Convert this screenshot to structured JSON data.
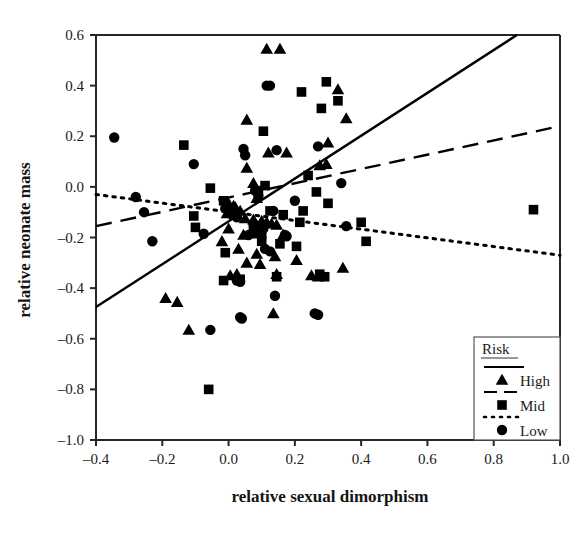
{
  "chart_data": {
    "type": "scatter",
    "title": "",
    "xlabel": "relative sexual dimorphism",
    "ylabel": "relative neonate mass",
    "xlim": [
      -0.4,
      1.0
    ],
    "ylim": [
      -1.0,
      0.6
    ],
    "xticks": [
      "-0.4",
      "-0.2",
      "0.0",
      "0.2",
      "0.4",
      "0.6",
      "0.8",
      "1.0"
    ],
    "xtick_values": [
      -0.4,
      -0.2,
      0.0,
      0.2,
      0.4,
      0.6,
      0.8,
      1.0
    ],
    "yticks": [
      "0.6",
      "0.4",
      "0.2",
      "0.0",
      "-0.2",
      "-0.4",
      "-0.6",
      "-0.8",
      "-1.0"
    ],
    "ytick_values": [
      0.6,
      0.4,
      0.2,
      0.0,
      -0.2,
      -0.4,
      -0.6,
      -0.8,
      -1.0
    ],
    "grid": false,
    "legend_position": "bottom-right",
    "legend_title": "Risk",
    "series": [
      {
        "name": "High",
        "marker": "triangle",
        "line_style": "solid",
        "color": "#000000",
        "points": [
          [
            0.115,
            0.545
          ],
          [
            0.155,
            0.545
          ],
          [
            0.33,
            0.385
          ],
          [
            0.055,
            0.265
          ],
          [
            0.12,
            0.135
          ],
          [
            0.175,
            0.135
          ],
          [
            0.055,
            0.075
          ],
          [
            0.075,
            0.015
          ],
          [
            0.355,
            0.27
          ],
          [
            0.3,
            0.175
          ],
          [
            0.085,
            -0.045
          ],
          [
            0.275,
            0.085
          ],
          [
            0.295,
            0.09
          ],
          [
            0.0,
            -0.065
          ],
          [
            0.015,
            -0.075
          ],
          [
            0.02,
            -0.08
          ],
          [
            0.035,
            -0.095
          ],
          [
            -0.005,
            -0.105
          ],
          [
            0.05,
            -0.125
          ],
          [
            0.075,
            -0.13
          ],
          [
            0.1,
            -0.135
          ],
          [
            0.115,
            -0.14
          ],
          [
            0.13,
            -0.145
          ],
          [
            0.145,
            -0.15
          ],
          [
            0.085,
            -0.155
          ],
          [
            0.0,
            -0.165
          ],
          [
            0.045,
            -0.19
          ],
          [
            0.165,
            -0.19
          ],
          [
            -0.02,
            -0.215
          ],
          [
            0.03,
            -0.245
          ],
          [
            0.085,
            -0.265
          ],
          [
            0.14,
            -0.275
          ],
          [
            0.205,
            -0.29
          ],
          [
            0.055,
            -0.3
          ],
          [
            0.095,
            -0.305
          ],
          [
            0.345,
            -0.32
          ],
          [
            0.005,
            -0.35
          ],
          [
            0.145,
            -0.345
          ],
          [
            0.25,
            -0.35
          ],
          [
            0.27,
            -0.355
          ],
          [
            0.135,
            -0.5
          ],
          [
            -0.19,
            -0.44
          ],
          [
            -0.155,
            -0.455
          ],
          [
            -0.12,
            -0.565
          ],
          [
            0.025,
            -0.345
          ]
        ],
        "fit_line": {
          "x0": -0.4,
          "y0": -0.475,
          "x1": 0.87,
          "y1": 0.6
        }
      },
      {
        "name": "Mid",
        "marker": "square",
        "line_style": "dashed",
        "color": "#000000",
        "points": [
          [
            0.295,
            0.415
          ],
          [
            0.33,
            0.34
          ],
          [
            0.28,
            0.31
          ],
          [
            0.22,
            0.375
          ],
          [
            0.105,
            0.22
          ],
          [
            -0.135,
            0.165
          ],
          [
            0.24,
            0.045
          ],
          [
            0.265,
            -0.02
          ],
          [
            0.3,
            -0.065
          ],
          [
            -0.055,
            -0.005
          ],
          [
            0.09,
            -0.015
          ],
          [
            0.11,
            0.005
          ],
          [
            -0.105,
            -0.115
          ],
          [
            -0.1,
            -0.16
          ],
          [
            -0.015,
            -0.055
          ],
          [
            0.015,
            -0.11
          ],
          [
            0.125,
            -0.095
          ],
          [
            0.165,
            -0.11
          ],
          [
            0.205,
            -0.235
          ],
          [
            0.215,
            -0.14
          ],
          [
            0.225,
            -0.095
          ],
          [
            0.075,
            -0.16
          ],
          [
            0.085,
            -0.185
          ],
          [
            0.1,
            -0.215
          ],
          [
            0.155,
            -0.225
          ],
          [
            0.4,
            -0.14
          ],
          [
            0.415,
            -0.215
          ],
          [
            0.92,
            -0.09
          ],
          [
            -0.01,
            -0.26
          ],
          [
            -0.015,
            -0.37
          ],
          [
            0.035,
            -0.365
          ],
          [
            0.275,
            -0.345
          ],
          [
            0.29,
            -0.355
          ],
          [
            0.145,
            -0.355
          ],
          [
            0.1,
            -0.185
          ],
          [
            -0.06,
            -0.8
          ]
        ],
        "fit_line": {
          "x0": -0.4,
          "y0": -0.155,
          "x1": 1.0,
          "y1": 0.24
        }
      },
      {
        "name": "Low",
        "marker": "circle",
        "line_style": "dotted",
        "color": "#000000",
        "points": [
          [
            -0.345,
            0.195
          ],
          [
            0.115,
            0.4
          ],
          [
            0.125,
            0.4
          ],
          [
            0.27,
            0.16
          ],
          [
            0.045,
            0.15
          ],
          [
            0.05,
            0.125
          ],
          [
            -0.105,
            0.09
          ],
          [
            0.145,
            0.145
          ],
          [
            -0.28,
            -0.04
          ],
          [
            -0.255,
            -0.1
          ],
          [
            0.08,
            -0.015
          ],
          [
            0.09,
            -0.035
          ],
          [
            0.135,
            -0.095
          ],
          [
            -0.01,
            -0.085
          ],
          [
            0.025,
            -0.12
          ],
          [
            0.075,
            -0.145
          ],
          [
            0.105,
            -0.165
          ],
          [
            0.2,
            -0.055
          ],
          [
            0.34,
            0.015
          ],
          [
            -0.23,
            -0.215
          ],
          [
            -0.075,
            -0.185
          ],
          [
            0.11,
            -0.245
          ],
          [
            0.125,
            -0.255
          ],
          [
            0.355,
            -0.155
          ],
          [
            0.06,
            -0.19
          ],
          [
            0.025,
            -0.37
          ],
          [
            0.035,
            -0.375
          ],
          [
            0.17,
            -0.19
          ],
          [
            0.175,
            -0.195
          ],
          [
            0.035,
            -0.515
          ],
          [
            0.04,
            -0.52
          ],
          [
            -0.055,
            -0.565
          ],
          [
            0.26,
            -0.5
          ],
          [
            0.27,
            -0.505
          ],
          [
            0.14,
            -0.43
          ]
        ],
        "fit_line": {
          "x0": -0.4,
          "y0": -0.03,
          "x1": 1.0,
          "y1": -0.27
        }
      }
    ]
  },
  "legend": {
    "title": "Risk",
    "entries": [
      {
        "label": "High",
        "marker": "triangle",
        "line": "solid"
      },
      {
        "label": "Mid",
        "marker": "square",
        "line": "dashed"
      },
      {
        "label": "Low",
        "marker": "circle",
        "line": "dotted"
      }
    ]
  }
}
